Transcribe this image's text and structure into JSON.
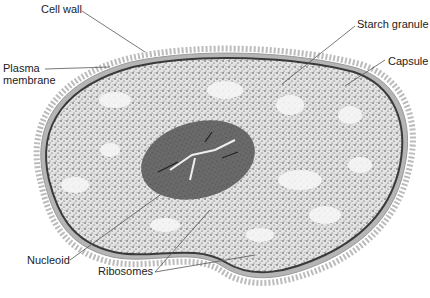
{
  "diagram": {
    "colors": {
      "background": "#ffffff",
      "cytoplasm": "#d9d9d9",
      "nucleoid": "#6e6e6e",
      "membrane": "#3a3a3a",
      "wall": "#b5b5b5",
      "leader": "#555555"
    },
    "labels": {
      "cell_wall": "Cell wall",
      "plasma_membrane_1": "Plasma",
      "plasma_membrane_2": "membrane",
      "starch_granule": "Starch granule",
      "capsule": "Capsule",
      "nucleoid": "Nucleoid",
      "ribosomes": "Ribosomes"
    }
  }
}
